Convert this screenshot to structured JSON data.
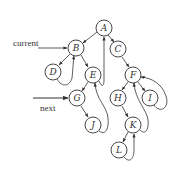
{
  "diagram": {
    "title": "",
    "labels": {
      "current": "current",
      "next": "next"
    },
    "nodes": [
      {
        "id": "A",
        "label": "A",
        "x": 104,
        "y": 28
      },
      {
        "id": "B",
        "label": "B",
        "x": 76,
        "y": 48
      },
      {
        "id": "C",
        "label": "C",
        "x": 118,
        "y": 49
      },
      {
        "id": "D",
        "label": "D",
        "x": 53,
        "y": 72
      },
      {
        "id": "E",
        "label": "E",
        "x": 93,
        "y": 75
      },
      {
        "id": "F",
        "label": "F",
        "x": 133,
        "y": 75
      },
      {
        "id": "G",
        "label": "G",
        "x": 77,
        "y": 98
      },
      {
        "id": "H",
        "label": "H",
        "x": 118,
        "y": 98
      },
      {
        "id": "I",
        "label": "I",
        "x": 150,
        "y": 98
      },
      {
        "id": "J",
        "label": "J",
        "x": 93,
        "y": 125
      },
      {
        "id": "K",
        "label": "K",
        "x": 133,
        "y": 125
      },
      {
        "id": "L",
        "label": "L",
        "x": 119,
        "y": 150
      }
    ],
    "tree_edges": [
      [
        "A",
        "B"
      ],
      [
        "A",
        "C"
      ],
      [
        "B",
        "D"
      ],
      [
        "B",
        "E"
      ],
      [
        "C",
        "F"
      ],
      [
        "E",
        "G"
      ],
      [
        "F",
        "H"
      ],
      [
        "F",
        "I"
      ],
      [
        "G",
        "J"
      ],
      [
        "H",
        "K"
      ],
      [
        "K",
        "L"
      ]
    ],
    "thread_edges": [
      [
        "D",
        "B"
      ],
      [
        "E",
        "A"
      ],
      [
        "J",
        "E"
      ],
      [
        "I",
        "F"
      ],
      [
        "K",
        "F"
      ],
      [
        "L",
        "K"
      ]
    ],
    "pointers": [
      {
        "name": "current",
        "target": "B"
      },
      {
        "name": "next",
        "target": "G"
      }
    ]
  }
}
